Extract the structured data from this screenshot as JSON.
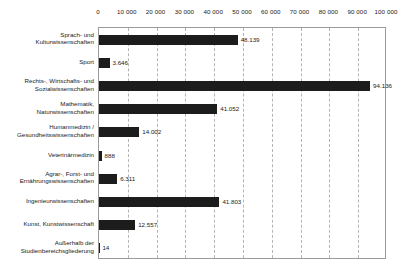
{
  "chart_data": {
    "type": "bar",
    "orientation": "horizontal",
    "title": "",
    "xlabel": "",
    "ylabel": "",
    "xlim": [
      0,
      100000
    ],
    "grid": true,
    "legend": "none",
    "tick_labels": [
      "0",
      "10 000",
      "20 000",
      "30 000",
      "40 000",
      "50 000",
      "60 000",
      "70 000",
      "80 000",
      "90 000",
      "100 000"
    ],
    "tick_values": [
      0,
      10000,
      20000,
      30000,
      40000,
      50000,
      60000,
      70000,
      80000,
      90000,
      100000
    ],
    "categories": [
      "Sprach- und Kulturwissenschaften",
      "Sport",
      "Rechts-, Wirtschafts- und Sozialwissenschaften",
      "Mathematik, Naturwissenschaften",
      "Humanmedizin / Gesundheitswissenschaften",
      "Veterinärmedizin",
      "Agrar-, Forst- und Ernährungswissenschaften",
      "Ingenieurwissenschaften",
      "Kunst, Kunstwissenschaft",
      "Außerhalb der Studienbereichsgliederung"
    ],
    "category_lines": [
      [
        "Sprach- und",
        "Kulturwissenschaften"
      ],
      [
        "Sport"
      ],
      [
        "Rechts-, Wirtschafts- und",
        "Sozialwissenschaften"
      ],
      [
        "Mathematik,",
        "Naturwissenschaften"
      ],
      [
        "Humanmedizin /",
        "Gesundheitswissenschaften"
      ],
      [
        "Veterinärmedizin"
      ],
      [
        "Agrar-, Forst- und",
        "Ernährungswissenschaften"
      ],
      [
        "Ingenieurwissenschaften"
      ],
      [
        "Kunst, Kunstwissenschaft"
      ],
      [
        "Außerhalb der",
        "Studienbereichsgliederung"
      ]
    ],
    "values": [
      48139,
      3646,
      94136,
      41052,
      14002,
      888,
      6311,
      41803,
      12557,
      14
    ],
    "value_labels": [
      "48.139",
      "3.646",
      "94.136",
      "41.052",
      "14.002",
      "888",
      "6.311",
      "41.803",
      "12.557",
      "14"
    ],
    "bar_color": "#1c1c1c",
    "grid_color": "#b4b4b4",
    "frame_color": "#9a9a9a"
  }
}
